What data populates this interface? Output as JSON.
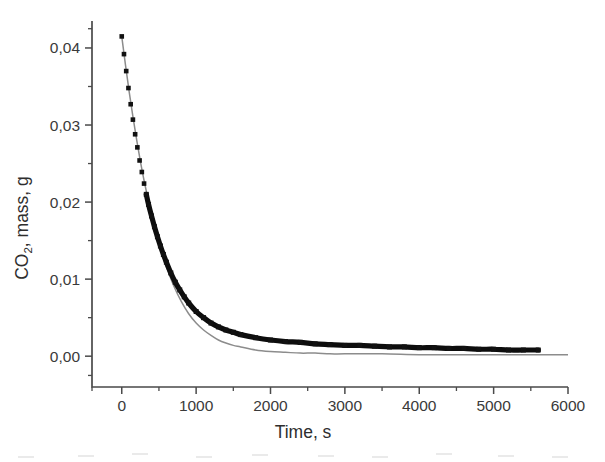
{
  "figure": {
    "background": "#ffffff",
    "width": 605,
    "height": 462
  },
  "axes": {
    "x_title": "Time, s",
    "y_title_main": "CO",
    "y_title_sub": "2",
    "y_title_rest": ", mass, g",
    "x_tick_labels": [
      "0",
      "1000",
      "2000",
      "3000",
      "4000",
      "5000",
      "6000"
    ],
    "y_tick_labels": [
      "0,00",
      "0,01",
      "0,02",
      "0,03",
      "0,04"
    ]
  },
  "chart_data": {
    "type": "line",
    "title": "",
    "xlabel": "Time, s",
    "ylabel": "CO2, mass, g",
    "xlim": [
      -400,
      6000
    ],
    "ylim": [
      -0.004,
      0.0435
    ],
    "xticks": [
      0,
      1000,
      2000,
      3000,
      4000,
      5000,
      6000
    ],
    "yticks": [
      0.0,
      0.01,
      0.02,
      0.03,
      0.04
    ],
    "xtick_labels": [
      "0",
      "1000",
      "2000",
      "3000",
      "4000",
      "5000",
      "6000"
    ],
    "ytick_labels": [
      "0,00",
      "0,01",
      "0,02",
      "0,03",
      "0,04"
    ],
    "x_minor_tick_step": 500,
    "y_minor_tick_step": 0.005,
    "grid": false,
    "legend": null,
    "decimal_separator": ",",
    "series": [
      {
        "name": "experimental CO2 mass",
        "style": "square-markers-dense",
        "color": "#111111",
        "marker": "square",
        "x": [
          0,
          30,
          60,
          90,
          120,
          150,
          180,
          210,
          240,
          270,
          300,
          330,
          360,
          400,
          440,
          480,
          520,
          560,
          600,
          660,
          720,
          780,
          840,
          900,
          1000,
          1100,
          1200,
          1300,
          1400,
          1500,
          1600,
          1800,
          2000,
          2200,
          2400,
          2600,
          2800,
          3000,
          3200,
          3400,
          3600,
          3800,
          4000,
          4200,
          4400,
          4600,
          4800,
          5000,
          5200,
          5400,
          5600
        ],
        "y": [
          0.0415,
          0.0392,
          0.037,
          0.0348,
          0.0327,
          0.0307,
          0.0288,
          0.0271,
          0.0254,
          0.0239,
          0.0224,
          0.021,
          0.0197,
          0.0182,
          0.0168,
          0.0155,
          0.0143,
          0.0132,
          0.0122,
          0.0108,
          0.0096,
          0.0086,
          0.0077,
          0.0069,
          0.0058,
          0.005,
          0.0043,
          0.0038,
          0.0034,
          0.0031,
          0.0028,
          0.0024,
          0.0021,
          0.0019,
          0.0018,
          0.0016,
          0.0015,
          0.0014,
          0.0014,
          0.0013,
          0.0012,
          0.0012,
          0.0011,
          0.0011,
          0.001,
          0.001,
          0.0009,
          0.0009,
          0.0008,
          0.0008,
          0.0008
        ]
      },
      {
        "name": "model fit",
        "style": "thin-line",
        "color": "#8c8c8c",
        "marker": "none",
        "x": [
          0,
          50,
          100,
          150,
          200,
          250,
          300,
          350,
          400,
          450,
          500,
          550,
          600,
          700,
          800,
          900,
          1000,
          1100,
          1200,
          1300,
          1400,
          1500,
          1600,
          1800,
          2000,
          2200,
          2400,
          2600,
          2800,
          3000,
          3500,
          4000,
          4500,
          5000,
          5500,
          6000
        ],
        "y": [
          0.0415,
          0.0378,
          0.0343,
          0.0311,
          0.0281,
          0.0253,
          0.0228,
          0.0205,
          0.0183,
          0.0164,
          0.0146,
          0.013,
          0.0116,
          0.0091,
          0.0071,
          0.0055,
          0.0043,
          0.0034,
          0.0027,
          0.0021,
          0.0017,
          0.0014,
          0.0012,
          0.0008,
          0.0006,
          0.0005,
          0.0004,
          0.0004,
          0.0003,
          0.0003,
          0.0003,
          0.0002,
          0.0002,
          0.0002,
          0.0002,
          0.0002
        ]
      }
    ]
  }
}
